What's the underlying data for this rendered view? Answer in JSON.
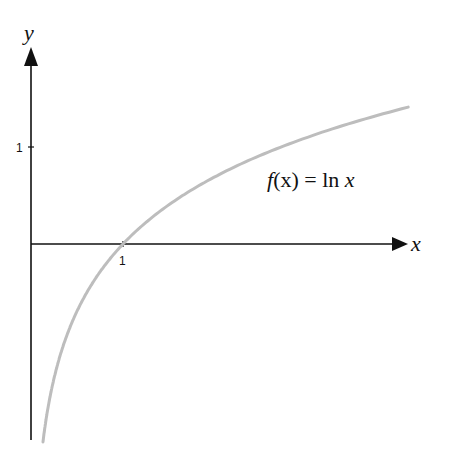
{
  "chart_data": {
    "type": "line",
    "title": "",
    "xlabel": "x",
    "ylabel": "y",
    "x_ticks": [
      "1"
    ],
    "y_ticks": [
      "1"
    ],
    "xlim": [
      0,
      4.1
    ],
    "ylim": [
      -2.0,
      2.0
    ],
    "grid": false,
    "legend": null,
    "annotations": [
      {
        "text": "f(x) = ln x",
        "x": 2.7,
        "y": 0.6
      }
    ],
    "series": [
      {
        "name": "f(x) = ln x",
        "color": "#bdbdbd",
        "x": [
          0.13,
          0.2,
          0.3,
          0.5,
          0.75,
          1,
          1.5,
          2,
          2.5,
          3,
          3.5,
          4.1
        ],
        "values": [
          -2.04,
          -1.61,
          -1.2,
          -0.69,
          -0.29,
          0,
          0.41,
          0.69,
          0.92,
          1.1,
          1.25,
          1.41
        ]
      }
    ]
  },
  "labels": {
    "x_axis": "x",
    "y_axis": "y",
    "x_tick": "1",
    "y_tick": "1",
    "fn_f": "f",
    "fn_rest": "(x) = ln ",
    "fn_x": "x"
  },
  "colors": {
    "axis": "#111111",
    "curve": "#bdbdbd"
  }
}
